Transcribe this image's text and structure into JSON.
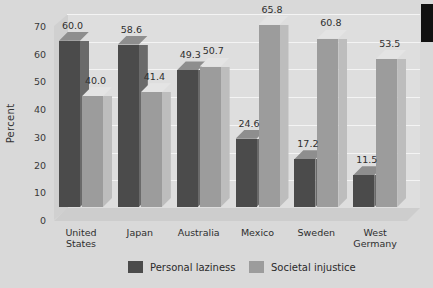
{
  "chart_data": {
    "type": "bar",
    "title": "",
    "xlabel": "",
    "ylabel": "Percent",
    "ylim": [
      0,
      70
    ],
    "yticks": [
      0,
      10,
      20,
      30,
      40,
      50,
      60,
      70
    ],
    "grid": true,
    "legend_position": "bottom",
    "categories": [
      "United States",
      "Japan",
      "Australia",
      "Mexico",
      "Sweden",
      "West Germany"
    ],
    "category_lines": [
      [
        "United",
        "States"
      ],
      [
        "Japan",
        ""
      ],
      [
        "Australia",
        ""
      ],
      [
        "Mexico",
        ""
      ],
      [
        "Sweden",
        ""
      ],
      [
        "West",
        "Germany"
      ]
    ],
    "series": [
      {
        "name": "Personal laziness",
        "color": "#4b4b4b",
        "values": [
          60.0,
          58.6,
          49.3,
          24.6,
          17.2,
          11.5
        ],
        "labels": [
          "60.0",
          "58.6",
          "49.3",
          "24.6",
          "17.2",
          "11.5"
        ]
      },
      {
        "name": "Societal injustice",
        "color": "#9c9c9c",
        "values": [
          40.0,
          41.4,
          50.7,
          65.8,
          60.8,
          53.5
        ],
        "labels": [
          "40.0",
          "41.4",
          "50.7",
          "65.8",
          "60.8",
          "53.5"
        ]
      }
    ]
  },
  "axis": {
    "y_tick_labels": [
      "70",
      "60",
      "50",
      "40",
      "30",
      "20",
      "10",
      "0"
    ],
    "y_axis_title": "Percent"
  },
  "legend": {
    "items": [
      {
        "label": "Personal laziness",
        "color": "#4b4b4b"
      },
      {
        "label": "Societal injustice",
        "color": "#9c9c9c"
      }
    ]
  }
}
